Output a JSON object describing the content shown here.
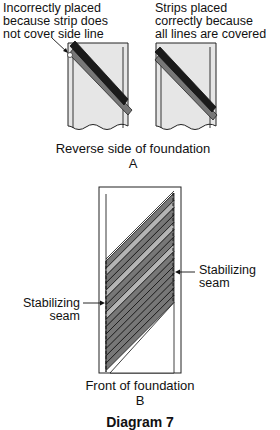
{
  "panel_a": {
    "left_label": [
      "Incorrectly placed",
      "because strip does",
      "not cover side line"
    ],
    "right_label": [
      "Strips placed",
      "correctly because",
      "all lines are covered"
    ],
    "caption": "Reverse side of foundation",
    "letter": "A"
  },
  "panel_b": {
    "right_seam_label": [
      "Stabilizing",
      "seam"
    ],
    "left_seam_label": [
      "Stabilizing",
      "seam"
    ],
    "caption": "Front of foundation",
    "letter": "B"
  },
  "figure_title": "Diagram 7",
  "colors": {
    "foundation_fill": "#e6e6e6",
    "strip_dark": "#1a1a1a",
    "strip_gray": "#777777",
    "strip_light": "#b5b5b5",
    "outline": "#222222"
  }
}
